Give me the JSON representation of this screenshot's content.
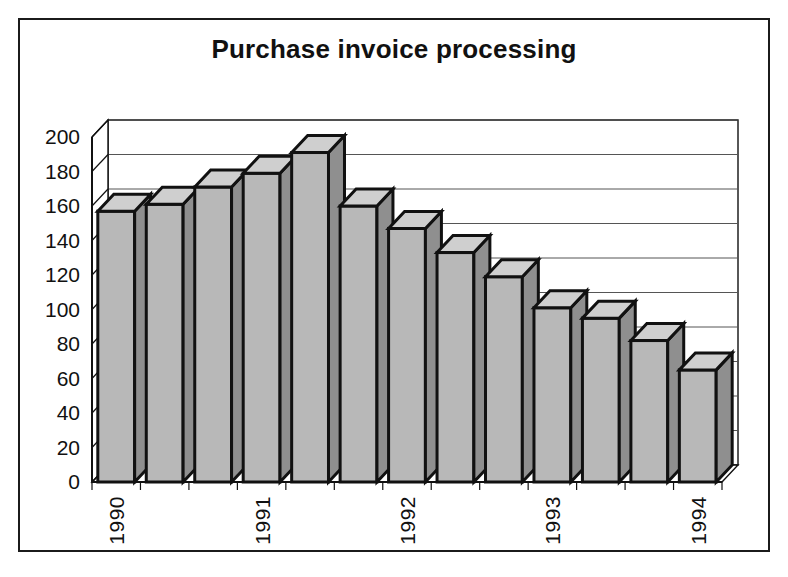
{
  "chart_data": {
    "type": "bar",
    "title": "Purchase invoice processing",
    "xlabel": "",
    "ylabel": "",
    "ylim": [
      0,
      200
    ],
    "ytick_step": 20,
    "yticks": [
      0,
      20,
      40,
      60,
      80,
      100,
      120,
      140,
      160,
      180,
      200
    ],
    "ytick_labels": [
      "0",
      "20",
      "40",
      "60",
      "80",
      "100",
      "120",
      "140",
      "160",
      "180",
      "200"
    ],
    "grid": true,
    "legend": false,
    "style": "3d-column",
    "categories": [
      "1990",
      "",
      "",
      "1991",
      "",
      "",
      "1992",
      "",
      "",
      "1993",
      "",
      "",
      "1994"
    ],
    "xtick_labels": [
      "1990",
      "1991",
      "1992",
      "1993",
      "1994"
    ],
    "xtick_label_positions": [
      0,
      3,
      6,
      9,
      12
    ],
    "xtick_label_rotation": 90,
    "values": [
      157,
      161,
      171,
      179,
      191,
      160,
      147,
      133,
      119,
      101,
      95,
      82,
      65
    ],
    "bar_count": 13,
    "colors": {
      "bar_front": "#b8b8b8",
      "bar_top": "#cfcfcf",
      "bar_side": "#8f8f8f",
      "bar_outline": "#111111",
      "grid": "#555555",
      "axis": "#111111",
      "frame": "#1b1b1b",
      "background": "#ffffff",
      "text": "#111111"
    }
  }
}
